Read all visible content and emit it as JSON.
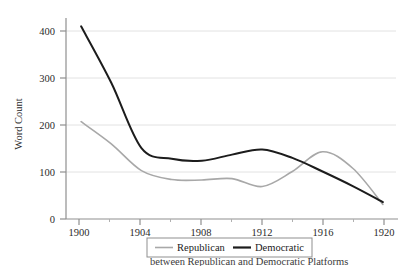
{
  "figure": {
    "background": "#ffffff",
    "caption_partial": "between Republican and Democratic Platforms"
  },
  "chart_data": {
    "type": "line",
    "title": "",
    "xlabel": "",
    "ylabel": "Word Count",
    "xlim": [
      1899,
      1921
    ],
    "ylim": [
      0,
      440
    ],
    "grid": "horizontal",
    "x_ticks": [
      1900,
      1904,
      1908,
      1912,
      1916,
      1920
    ],
    "x_tick_labels": [
      "1900",
      "1904",
      "1908",
      "1912",
      "1916",
      "1920"
    ],
    "x_minor_ticks": [
      1902,
      1906,
      1910,
      1914,
      1918
    ],
    "y_ticks": [
      0,
      100,
      200,
      300,
      400
    ],
    "y_tick_labels": [
      "0",
      "100",
      "200",
      "300",
      "400"
    ],
    "legend_position": "below-center",
    "series": [
      {
        "name": "Republican",
        "color": "#a8a8a8",
        "linewidth": 1.6,
        "x": [
          1900,
          1902,
          1904,
          1906,
          1908,
          1910,
          1912,
          1914,
          1916,
          1918,
          1920
        ],
        "values": [
          207,
          160,
          103,
          84,
          83,
          86,
          69,
          101,
          143,
          108,
          31
        ]
      },
      {
        "name": "Democratic",
        "color": "#1c1c1c",
        "linewidth": 2.0,
        "x": [
          1900,
          1902,
          1904,
          1906,
          1908,
          1910,
          1912,
          1914,
          1916,
          1918,
          1920
        ],
        "values": [
          410,
          290,
          151,
          128,
          124,
          137,
          148,
          130,
          101,
          70,
          36
        ]
      }
    ]
  },
  "legend": {
    "items": [
      {
        "label": "Republican",
        "color": "#a8a8a8"
      },
      {
        "label": "Democratic",
        "color": "#1c1c1c"
      }
    ]
  },
  "axes": {
    "y_title": "Word Count"
  }
}
